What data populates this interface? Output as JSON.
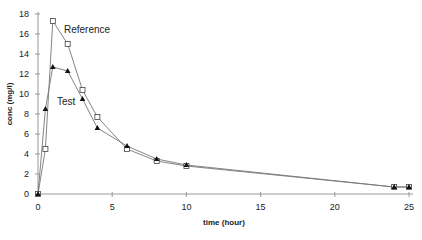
{
  "chart_data": {
    "type": "line",
    "title": "",
    "xlabel": "time (hour)",
    "ylabel": "conc (mg/l)",
    "xlim": [
      0,
      25
    ],
    "ylim": [
      0,
      18
    ],
    "xticks": [
      0,
      5,
      10,
      15,
      20,
      25
    ],
    "yticks": [
      0,
      2,
      4,
      6,
      8,
      10,
      12,
      14,
      16,
      18
    ],
    "grid": false,
    "legend": "inline annotations",
    "series": [
      {
        "name": "Reference",
        "marker": "open-square",
        "x": [
          0,
          0.5,
          1,
          2,
          3,
          4,
          6,
          8,
          10,
          24,
          25
        ],
        "values": [
          0,
          4.5,
          17.3,
          15.0,
          10.4,
          7.7,
          4.5,
          3.3,
          2.8,
          0.7,
          0.7
        ]
      },
      {
        "name": "Test",
        "marker": "filled-triangle",
        "x": [
          0,
          0.5,
          1,
          2,
          3,
          4,
          6,
          8,
          10,
          24,
          25
        ],
        "values": [
          0,
          8.5,
          12.7,
          12.3,
          9.5,
          6.6,
          4.8,
          3.5,
          2.9,
          0.7,
          0.7
        ]
      }
    ],
    "annotations": [
      {
        "text": "Reference",
        "x": 2.5,
        "y": 17.0
      },
      {
        "text": "Test",
        "x": 2.3,
        "y": 9.7
      }
    ]
  }
}
